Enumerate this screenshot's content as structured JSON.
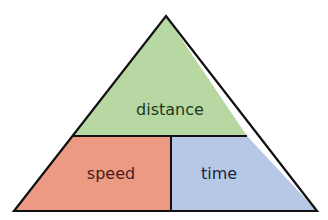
{
  "diagram": {
    "sections": {
      "top": {
        "label": "distance",
        "fill": "#b8d8a3",
        "text_color": "#1e3a1e"
      },
      "bottom_left": {
        "label": "speed",
        "fill": "#ec9a84",
        "text_color": "#4a1a1a"
      },
      "bottom_right": {
        "label": "time",
        "fill": "#b6c8e6",
        "text_color": "#1a2540"
      }
    },
    "outline_color": "#111111"
  }
}
